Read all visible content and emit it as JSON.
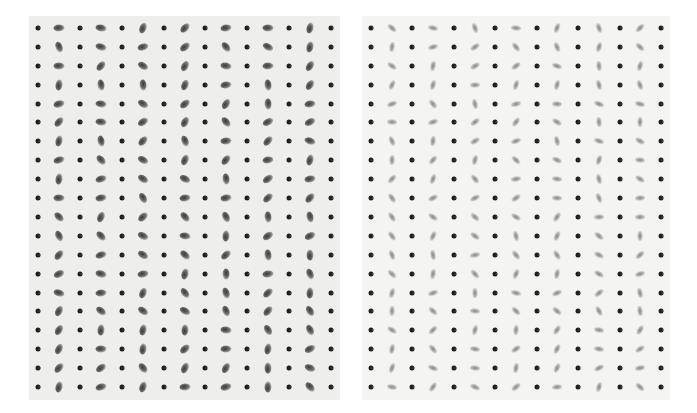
{
  "figure": {
    "panels": [
      {
        "id": "left",
        "description": "grid of black crescent dots alternating with dark smudged blobs",
        "columns": 15,
        "rows": 20,
        "blob_style": "sharp"
      },
      {
        "id": "right",
        "description": "grid of black crescent dots alternating with soft grey blurred blobs",
        "columns": 15,
        "rows": 20,
        "blob_style": "soft"
      }
    ],
    "colors": {
      "background": "#ffffff",
      "paper_left": "#eeeeed",
      "paper_right": "#f4f4f3",
      "dot": "#1e1e1e",
      "blob": "#6b6b6b"
    }
  }
}
